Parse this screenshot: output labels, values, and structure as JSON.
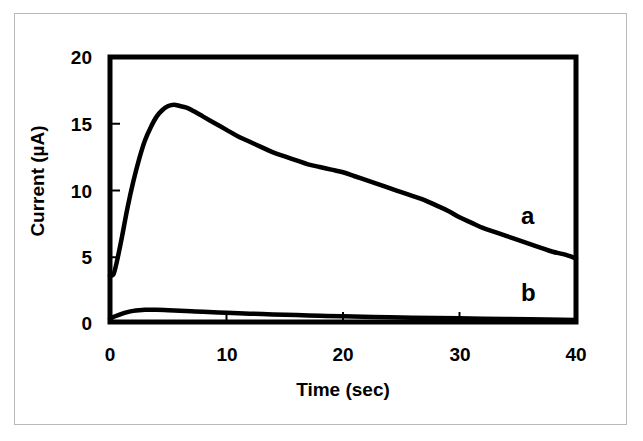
{
  "figure": {
    "background_color": "#ffffff",
    "border_color": "#b9b9b9",
    "line_color": "#000000"
  },
  "chart_data": {
    "type": "line",
    "title": "",
    "xlabel": "Time (sec)",
    "ylabel": "Current (µA)",
    "xlim": [
      0,
      40
    ],
    "ylim": [
      0,
      20
    ],
    "xticks": [
      0,
      10,
      20,
      30,
      40
    ],
    "yticks": [
      0,
      5,
      10,
      15,
      20
    ],
    "xtick_labels": [
      "0",
      "10",
      "20",
      "30",
      "40"
    ],
    "ytick_labels": [
      "0",
      "5",
      "10",
      "15",
      "20"
    ],
    "grid": false,
    "legend_position": "inline-annotations",
    "annotations": [
      {
        "text": "a",
        "x": 37.0,
        "y": 9.5
      },
      {
        "text": "b",
        "x": 37.0,
        "y": 3.7
      }
    ],
    "series": [
      {
        "name": "a",
        "label": "a",
        "color": "#000000",
        "line_width": 4.5,
        "x": [
          0,
          0.3,
          0.6,
          1.0,
          1.5,
          2.0,
          2.5,
          3.0,
          3.5,
          4.0,
          4.5,
          5.0,
          5.5,
          6.0,
          6.5,
          7.0,
          8.0,
          9.0,
          10.0,
          11.0,
          12.0,
          13.0,
          14.0,
          15.0,
          16.0,
          17.0,
          18.0,
          19.0,
          20.0,
          21.0,
          22.0,
          23.0,
          24.0,
          25.0,
          26.0,
          27.0,
          28.0,
          29.0,
          30.0,
          31.0,
          32.0,
          33.0,
          34.0,
          35.0,
          36.0,
          37.0,
          38.0,
          39.0,
          40.0
        ],
        "y": [
          3.5,
          3.6,
          4.6,
          6.3,
          8.6,
          10.6,
          12.3,
          13.7,
          14.7,
          15.5,
          16.0,
          16.3,
          16.4,
          16.3,
          16.2,
          16.0,
          15.5,
          15.0,
          14.5,
          14.0,
          13.6,
          13.2,
          12.8,
          12.5,
          12.2,
          11.9,
          11.7,
          11.5,
          11.3,
          11.0,
          10.7,
          10.4,
          10.1,
          9.8,
          9.5,
          9.2,
          8.8,
          8.4,
          7.9,
          7.5,
          7.1,
          6.8,
          6.5,
          6.2,
          5.9,
          5.6,
          5.3,
          5.1,
          4.8
        ]
      },
      {
        "name": "b",
        "label": "b",
        "color": "#000000",
        "line_width": 4.5,
        "x": [
          0,
          0.5,
          1.0,
          1.5,
          2.0,
          2.5,
          3.0,
          3.5,
          4.0,
          5.0,
          6.0,
          7.0,
          8.0,
          10.0,
          12.0,
          14.0,
          16.0,
          18.0,
          20.0,
          24.0,
          28.0,
          32.0,
          36.0,
          40.0
        ],
        "y": [
          0.25,
          0.45,
          0.62,
          0.75,
          0.84,
          0.89,
          0.92,
          0.93,
          0.92,
          0.89,
          0.85,
          0.81,
          0.77,
          0.7,
          0.63,
          0.57,
          0.52,
          0.47,
          0.43,
          0.36,
          0.3,
          0.25,
          0.2,
          0.15
        ]
      }
    ]
  },
  "axes": {
    "frame_color": "#000000",
    "frame_width": 5
  }
}
